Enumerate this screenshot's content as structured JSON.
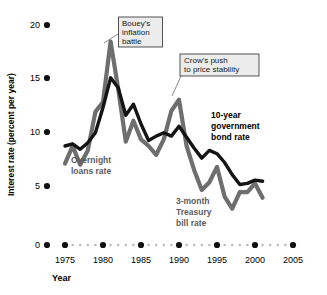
{
  "chart_data": {
    "type": "line",
    "title": "",
    "xlabel": "Year",
    "ylabel": "Interest rate (percent per year)",
    "xlim": [
      1974,
      2005.5
    ],
    "ylim": [
      0,
      20
    ],
    "yticks": [
      0,
      5,
      10,
      15,
      20
    ],
    "xticks": [
      1975,
      1980,
      1985,
      1990,
      1995,
      2000,
      2005
    ],
    "grid": false,
    "legend_position": "inline-annotations",
    "series": [
      {
        "name": "10-year government bond rate",
        "color": "#141414",
        "note": "black line; in the later years the black line is labelled 10-year government bond rate",
        "x": [
          1975,
          1976,
          1977,
          1978,
          1979,
          1980,
          1981,
          1982,
          1983,
          1984,
          1985,
          1986,
          1987,
          1988,
          1989,
          1990,
          1991,
          1992,
          1993,
          1994,
          1995,
          1996,
          1997,
          1998,
          1999,
          2000,
          2001
        ],
        "values": [
          9.0,
          9.2,
          8.7,
          9.3,
          10.2,
          12.5,
          15.2,
          14.3,
          11.8,
          12.8,
          11.0,
          9.5,
          9.9,
          10.2,
          9.9,
          10.8,
          9.8,
          8.8,
          7.9,
          8.6,
          8.3,
          7.5,
          6.4,
          5.5,
          5.6,
          5.9,
          5.8
        ]
      },
      {
        "name": "Overnight loans rate",
        "color": "#6e6e6e",
        "note": "gray line at the left/middle is the overnight loans rate; the same gray line at the right is labelled 3-month Treasury bill rate",
        "x": [
          1975,
          1976,
          1977,
          1978,
          1979,
          1980,
          1981,
          1982,
          1983,
          1984,
          1985,
          1986,
          1987,
          1988,
          1989,
          1990,
          1991,
          1992,
          1993,
          1994,
          1995,
          1996,
          1997,
          1998,
          1999,
          2000,
          2001
        ],
        "values": [
          7.4,
          9.0,
          7.3,
          8.6,
          12.1,
          13.0,
          18.5,
          14.2,
          9.4,
          11.3,
          9.6,
          9.0,
          8.2,
          9.6,
          12.2,
          13.2,
          9.0,
          6.8,
          5.0,
          5.7,
          7.1,
          4.4,
          3.3,
          4.8,
          4.8,
          5.6,
          4.3
        ]
      }
    ],
    "annotations": [
      {
        "name": "bouey-callout",
        "text_lines": [
          "Bouey's",
          "inflation",
          "battle"
        ],
        "points_to_year": 1981
      },
      {
        "name": "crow-callout",
        "text_lines": [
          "Crow's push",
          "to price stability"
        ],
        "points_to_year": 1990
      }
    ],
    "inline_labels": [
      {
        "name": "overnight-loans-label",
        "text_lines": [
          "Overnight",
          "loans rate"
        ],
        "color": "#5c5c5c"
      },
      {
        "name": "bond-rate-label",
        "text_lines": [
          "10-year",
          "government",
          "bond rate"
        ],
        "color": "#000000"
      },
      {
        "name": "tbill-label",
        "text_lines": [
          "3-month",
          "Treasury",
          "bill rate"
        ],
        "color": "#5c5c5c"
      }
    ]
  },
  "axis": {
    "y_title": "Interest rate (percent per year)",
    "x_title": "Year",
    "y_tick_labels": [
      "20",
      "15",
      "10",
      "5",
      "0"
    ],
    "x_tick_labels": [
      "1975",
      "1980",
      "1985",
      "1990",
      "1995",
      "2000",
      "2005"
    ]
  },
  "colors": {
    "bond_line": "#141414",
    "overnight_line": "#6e6e6e",
    "callout_fill": "#ececed",
    "callout_border": "#2b2b2b",
    "axis_dots": "#111111",
    "minor_dots": "#b9b9b9",
    "background": "#ffffff"
  }
}
